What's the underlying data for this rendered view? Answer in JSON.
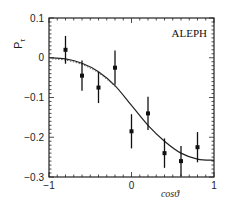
{
  "chart_data": {
    "type": "scatter",
    "title": "",
    "annotation": "ALEPH",
    "xlabel": "cosϑ",
    "ylabel": "Pτ",
    "xlim": [
      -1,
      1
    ],
    "ylim": [
      -0.3,
      0.1
    ],
    "x_ticks": [
      "-1",
      "0",
      "1"
    ],
    "y_ticks": [
      "0.1",
      "0",
      "-0.1",
      "-0.2",
      "-0.3"
    ],
    "grid": false,
    "series": [
      {
        "name": "data",
        "style": "points-with-error-bars",
        "x": [
          -0.8,
          -0.6,
          -0.4,
          -0.2,
          0.0,
          0.2,
          0.4,
          0.6,
          0.8
        ],
        "y": [
          0.02,
          -0.045,
          -0.075,
          -0.025,
          -0.185,
          -0.14,
          -0.24,
          -0.26,
          -0.225
        ],
        "yerr": [
          0.035,
          0.038,
          0.039,
          0.043,
          0.043,
          0.042,
          0.037,
          0.038,
          0.038
        ]
      },
      {
        "name": "fit",
        "style": "solid-line",
        "x": [
          -1.0,
          -0.8,
          -0.6,
          -0.4,
          -0.2,
          0.0,
          0.2,
          0.4,
          0.6,
          0.8,
          1.0
        ],
        "y": [
          0.0,
          -0.003,
          -0.014,
          -0.035,
          -0.07,
          -0.12,
          -0.17,
          -0.21,
          -0.24,
          -0.255,
          -0.258
        ]
      },
      {
        "name": "fit-dotted",
        "style": "dotted-line",
        "x": [
          -1.0,
          -0.8,
          -0.6,
          -0.4,
          -0.2
        ],
        "y": [
          -0.002,
          -0.006,
          -0.017,
          -0.038,
          -0.072
        ]
      }
    ]
  }
}
